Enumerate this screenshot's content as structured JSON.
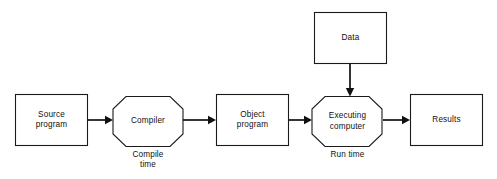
{
  "diagram": {
    "type": "flowchart",
    "background_color": "#ffffff",
    "stroke_color": "#111111",
    "nodes": [
      {
        "id": "source-program",
        "label": "Source\nprogram",
        "shape": "rectangle"
      },
      {
        "id": "compiler",
        "label": "Compiler",
        "shape": "octagon"
      },
      {
        "id": "object-program",
        "label": "Object\nprogram",
        "shape": "rectangle"
      },
      {
        "id": "data",
        "label": "Data",
        "shape": "rectangle"
      },
      {
        "id": "executing-computer",
        "label": "Executing\ncomputer",
        "shape": "octagon"
      },
      {
        "id": "results",
        "label": "Results",
        "shape": "rectangle"
      }
    ],
    "phase_labels": [
      {
        "id": "compile-time",
        "label": "Compile\ntime",
        "under": "compiler"
      },
      {
        "id": "run-time",
        "label": "Run time",
        "under": "executing-computer"
      }
    ],
    "edges": [
      {
        "id": "source-to-compiler",
        "from": "source-program",
        "to": "compiler",
        "direction": "right"
      },
      {
        "id": "compiler-to-object",
        "from": "compiler",
        "to": "object-program",
        "direction": "right"
      },
      {
        "id": "object-to-executing",
        "from": "object-program",
        "to": "executing-computer",
        "direction": "right"
      },
      {
        "id": "data-to-executing",
        "from": "data",
        "to": "executing-computer",
        "direction": "down"
      },
      {
        "id": "executing-to-results",
        "from": "executing-computer",
        "to": "results",
        "direction": "right"
      }
    ]
  }
}
